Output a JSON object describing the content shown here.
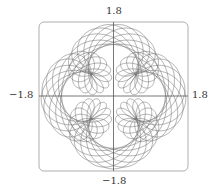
{
  "chart_data": {
    "type": "line",
    "subtype": "parametric",
    "title": "",
    "xlabel": "",
    "ylabel": "",
    "equations": {
      "x": "sin t + 1/2 sin 5t + 1/4 cos 2.3t",
      "y": "cos t + 1/2 cos 5t + 1/4 sin 2.3t"
    },
    "params": {
      "a1": 1,
      "f1": 1,
      "a2": 0.5,
      "f2": 5,
      "a3": 0.25,
      "f3": 2.3,
      "t_min": 0,
      "t_max": 62.832,
      "steps": 12000
    },
    "xlim": [
      -1.8,
      1.8
    ],
    "ylim": [
      -1.8,
      1.8
    ],
    "tick_labels": {
      "top": "1.8",
      "bottom": "−1.8",
      "left": "−1.8",
      "right": "1.8"
    },
    "axes_through_origin": true,
    "grid": false,
    "legend": null,
    "colors": {
      "curve": "#6e6e6e",
      "axes": "#555555",
      "frame": "#9a9a9a"
    }
  }
}
